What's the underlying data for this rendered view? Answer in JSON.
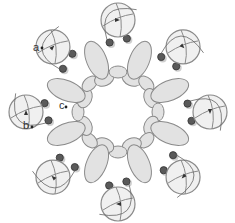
{
  "diagram": {
    "type": "beadwork-ring-diagram",
    "center": [
      118,
      112
    ],
    "petal_count": 8,
    "labels": [
      {
        "text": "a",
        "x": 34,
        "y": 43
      },
      {
        "text": "b",
        "x": 24,
        "y": 122
      },
      {
        "text": "c",
        "x": 58,
        "y": 102
      }
    ],
    "colors": {
      "stroke": "#8a8a8a",
      "fill_large": "#f0f0f0",
      "fill_oval": "#e2e2e2",
      "seed_dark": "#5a5a5a",
      "seed_light": "#cfcfcf",
      "thread": "#666666"
    }
  }
}
